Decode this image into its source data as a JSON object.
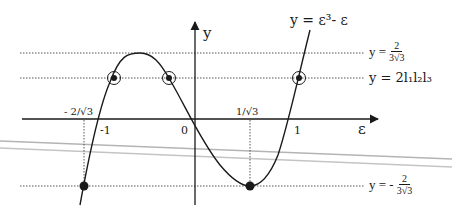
{
  "diagram": {
    "curve_label": "y = ε³- ε",
    "axes": {
      "x_label": "ε",
      "y_label": "y"
    },
    "ticks": {
      "neg_two_over_root3": "- 2/√3",
      "neg_one": "-1",
      "zero": "0",
      "one_over_root3": "1/√3",
      "one": "1"
    },
    "levels": {
      "max": {
        "prefix": "y =",
        "numerator": "2",
        "denominator": "3√3"
      },
      "product": {
        "label": "y = 2l₁l₂l₃"
      },
      "min": {
        "prefix": "y = -",
        "numerator": "2",
        "denominator": "3√3"
      }
    },
    "points": {
      "circled": [
        "left root crossing",
        "middle crossing",
        "right crossing"
      ],
      "filled": [
        "min at -2/√3",
        "min at 1/√3"
      ]
    },
    "colors": {
      "ink": "#1a1a1a",
      "dotted": "#555555",
      "artifact": "#b4b4b4"
    }
  }
}
